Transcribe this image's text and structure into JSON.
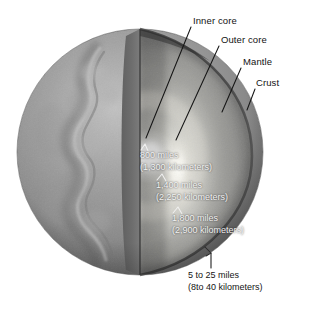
{
  "figure": {
    "background_color": "#ffffff"
  },
  "layer_labels": [
    {
      "id": "inner-core",
      "text": "Inner core"
    },
    {
      "id": "outer-core",
      "text": "Outer core"
    },
    {
      "id": "mantle",
      "text": "Mantle"
    },
    {
      "id": "crust",
      "text": "Crust"
    }
  ],
  "measurements": [
    {
      "id": "inner-core-depth",
      "miles": "800 miles",
      "kilometers": "(1,300 kilometers)"
    },
    {
      "id": "outer-core-depth",
      "miles": "1,400 miles",
      "kilometers": "(2,250 kilometers)"
    },
    {
      "id": "mantle-depth",
      "miles": "1,800 miles",
      "kilometers": "(2,900 kilometers)"
    },
    {
      "id": "crust-depth",
      "miles": "5 to 25 miles",
      "kilometers": "(8to 40 kilometers)"
    }
  ],
  "colors": {
    "background": "#ffffff",
    "globe_surface_dark": "#6e6e6e",
    "globe_surface_light": "#a9a9a9",
    "cut_face_mantle": "#8b8b8b",
    "cut_face_outer_core": "#c9c9c9",
    "inner_core_glow": "#f7f7f2",
    "crust_rim": "#3a3a3a",
    "leader_line": "#1a1a1a",
    "text": "#171717"
  }
}
